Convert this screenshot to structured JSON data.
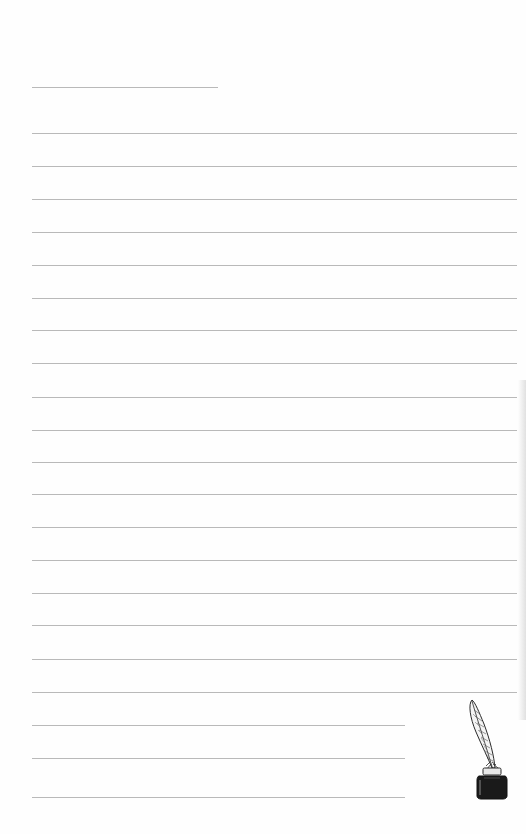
{
  "page": {
    "type": "lined-notepaper",
    "background_color": "#fefefe",
    "rule_color": "#b9b9b9",
    "title_line_top": 87,
    "full_line_tops": [
      133,
      166,
      199,
      232,
      265,
      298,
      330,
      363,
      397,
      430,
      462,
      494,
      527,
      560,
      593,
      625,
      659,
      692
    ],
    "short_line_tops": [
      725,
      758,
      797
    ],
    "decoration": {
      "icon": "quill-inkwell-icon",
      "ink_color": "#1a1a1a"
    }
  }
}
